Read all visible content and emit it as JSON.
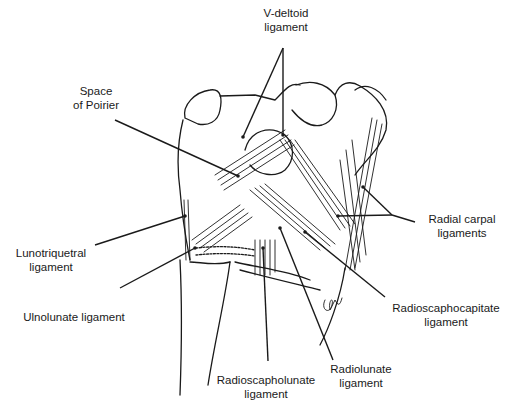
{
  "figure": {
    "type": "anatomical line drawing",
    "signature": "gm"
  },
  "labels": [
    {
      "id": "v-deltoid",
      "lines": [
        "V-deltoid",
        "ligament"
      ]
    },
    {
      "id": "space-of-poirier",
      "lines": [
        "Space",
        "of Poirier"
      ]
    },
    {
      "id": "radial-carpal",
      "lines": [
        "Radial carpal",
        "ligaments"
      ]
    },
    {
      "id": "lunotriquetral",
      "lines": [
        "Lunotriquetral",
        "ligament"
      ]
    },
    {
      "id": "ulnolunate",
      "lines": [
        "Ulnolunate ligament"
      ]
    },
    {
      "id": "radioscaphocapitate",
      "lines": [
        "Radioscaphocapitate",
        "ligament"
      ]
    },
    {
      "id": "radioscapholunate",
      "lines": [
        "Radioscapholunate",
        "ligament"
      ]
    },
    {
      "id": "radiolunate",
      "lines": [
        "Radiolunate",
        "ligament"
      ]
    }
  ],
  "colors": {
    "ink": "#1a1a1a",
    "background": "#ffffff"
  }
}
